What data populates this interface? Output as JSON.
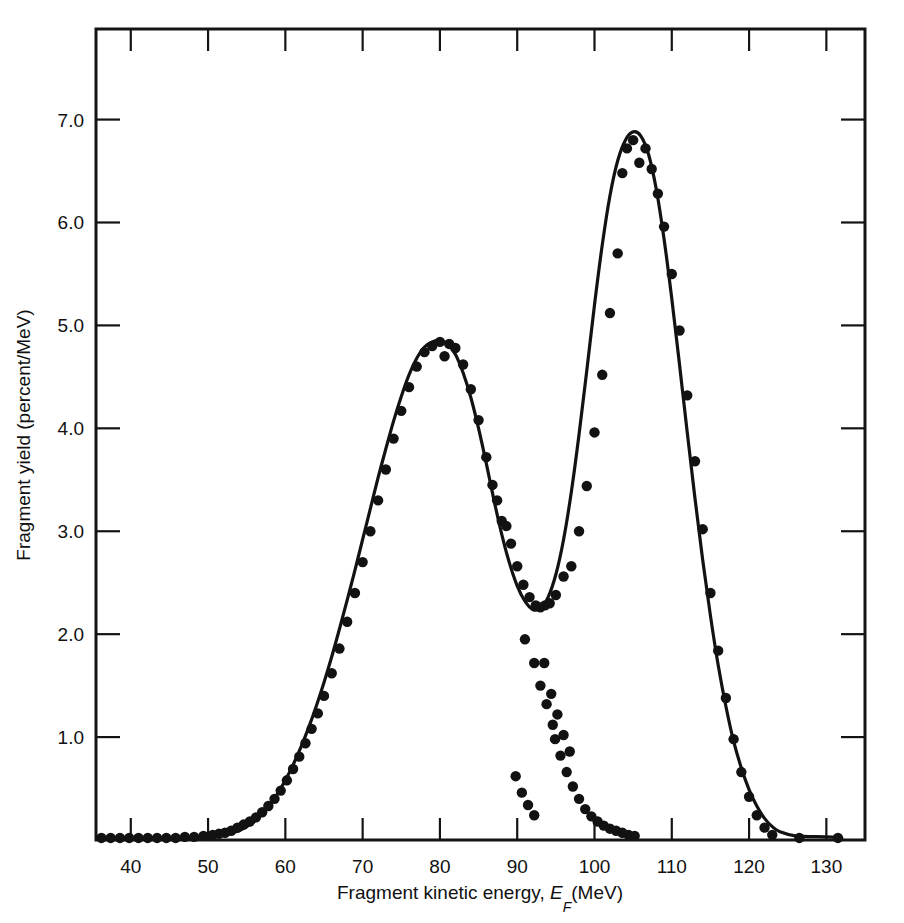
{
  "figure": {
    "background_color": "#ffffff",
    "ink_color": "#121212"
  },
  "axes": {
    "x": {
      "label_main": "Fragment kinetic energy,",
      "label_symbol": "E",
      "label_subscript": "F",
      "label_units": "(MeV)",
      "label_full": "Fragment kinetic energy, E_F(MeV)",
      "ticks": [
        40,
        50,
        60,
        70,
        80,
        90,
        100,
        110,
        120,
        130
      ],
      "tick_labels": [
        "40",
        "50",
        "60",
        "70",
        "80",
        "90",
        "100",
        "110",
        "120",
        "130"
      ],
      "range": [
        35.5,
        135.0
      ]
    },
    "y": {
      "label_full": "Fragment yield (percent/MeV)",
      "ticks": [
        1.0,
        2.0,
        3.0,
        4.0,
        5.0,
        6.0,
        7.0
      ],
      "tick_labels": [
        "1.0",
        "2.0",
        "3.0",
        "4.0",
        "5.0",
        "6.0",
        "7.0"
      ],
      "range": [
        0.0,
        7.88
      ]
    }
  },
  "chart_data": {
    "type": "scatter",
    "title": "",
    "subtitle": "",
    "xlabel": "Fragment kinetic energy, E_F(MeV)",
    "ylabel": "Fragment yield (percent/MeV)",
    "xlim": [
      35.5,
      135.0
    ],
    "ylim": [
      0.0,
      7.88
    ],
    "grid": false,
    "legend": "none",
    "series": [
      {
        "name": "fitted-curve",
        "type": "line",
        "marker": "none",
        "x": [
          36.0,
          40.0,
          44.0,
          48.0,
          52.0,
          54.0,
          55.0,
          56.0,
          57.0,
          58.0,
          59.0,
          60.0,
          61.0,
          62.0,
          63.0,
          64.0,
          65.0,
          66.0,
          67.0,
          68.0,
          69.0,
          70.0,
          71.0,
          72.0,
          73.0,
          74.0,
          75.0,
          76.0,
          77.0,
          78.0,
          79.0,
          80.0,
          81.0,
          82.0,
          83.0,
          84.0,
          85.0,
          86.0,
          87.0,
          88.0,
          89.0,
          90.0,
          91.0,
          92.0,
          93.0,
          94.0,
          95.0,
          96.0,
          97.0,
          98.0,
          99.0,
          100.0,
          101.0,
          102.0,
          103.0,
          104.0,
          105.0,
          106.0,
          107.0,
          108.0,
          109.0,
          110.0,
          111.0,
          112.0,
          113.0,
          114.0,
          115.0,
          116.0,
          117.0,
          118.0,
          119.0,
          120.0,
          121.0,
          122.0,
          123.0,
          124.0,
          126.0,
          130.0,
          132.0
        ],
        "y": [
          0.02,
          0.02,
          0.02,
          0.03,
          0.05,
          0.09,
          0.13,
          0.18,
          0.25,
          0.34,
          0.45,
          0.58,
          0.73,
          0.9,
          1.09,
          1.3,
          1.53,
          1.78,
          2.05,
          2.33,
          2.62,
          2.92,
          3.22,
          3.52,
          3.8,
          4.07,
          4.31,
          4.52,
          4.68,
          4.79,
          4.84,
          4.85,
          4.82,
          4.72,
          4.54,
          4.3,
          4.0,
          3.66,
          3.3,
          2.97,
          2.69,
          2.47,
          2.32,
          2.24,
          2.25,
          2.36,
          2.58,
          2.92,
          3.38,
          3.94,
          4.56,
          5.2,
          5.78,
          6.26,
          6.6,
          6.8,
          6.88,
          6.84,
          6.66,
          6.32,
          5.84,
          5.26,
          4.62,
          3.96,
          3.32,
          2.72,
          2.18,
          1.7,
          1.3,
          0.96,
          0.7,
          0.49,
          0.33,
          0.21,
          0.13,
          0.08,
          0.04,
          0.03,
          0.02
        ]
      },
      {
        "name": "measured-yield-points",
        "type": "scatter",
        "marker": "filled-circle",
        "x": [
          36.2,
          37.4,
          38.6,
          39.8,
          41.0,
          42.2,
          43.4,
          44.6,
          45.8,
          47.0,
          48.2,
          49.4,
          50.6,
          51.4,
          52.2,
          53.0,
          53.8,
          54.6,
          55.4,
          56.2,
          57.0,
          57.8,
          58.6,
          59.4,
          60.2,
          61.0,
          61.8,
          62.6,
          63.4,
          64.2,
          65.0,
          66.0,
          67.0,
          68.0,
          69.0,
          70.0,
          71.0,
          72.0,
          73.0,
          74.0,
          75.0,
          76.0,
          77.0,
          78.0,
          79.0,
          80.0,
          80.6,
          81.2,
          82.0,
          83.0,
          84.0,
          85.0,
          86.0,
          86.8,
          87.4,
          88.0,
          88.6,
          89.2,
          90.0,
          90.8,
          91.6,
          92.4,
          93.0,
          93.6,
          94.2,
          95.0,
          96.0,
          97.0,
          98.0,
          99.0,
          100.0,
          101.0,
          102.0,
          103.0,
          103.6,
          104.2,
          105.0,
          105.8,
          106.6,
          107.4,
          108.2,
          109.0,
          110.0,
          111.0,
          112.0,
          113.0,
          114.0,
          115.0,
          116.0,
          117.0,
          118.0,
          119.0,
          120.0,
          121.0,
          122.0,
          123.0,
          126.5,
          131.5
        ],
        "y": [
          0.02,
          0.02,
          0.02,
          0.02,
          0.02,
          0.02,
          0.02,
          0.02,
          0.02,
          0.03,
          0.03,
          0.04,
          0.05,
          0.06,
          0.07,
          0.09,
          0.12,
          0.15,
          0.18,
          0.22,
          0.27,
          0.33,
          0.4,
          0.48,
          0.58,
          0.69,
          0.81,
          0.94,
          1.08,
          1.23,
          1.4,
          1.62,
          1.86,
          2.12,
          2.4,
          2.7,
          3.0,
          3.3,
          3.6,
          3.9,
          4.17,
          4.4,
          4.6,
          4.74,
          4.8,
          4.84,
          4.7,
          4.82,
          4.78,
          4.62,
          4.38,
          4.08,
          3.72,
          3.45,
          3.3,
          3.1,
          3.05,
          2.88,
          2.66,
          2.48,
          2.36,
          2.28,
          2.26,
          2.28,
          2.3,
          2.38,
          2.56,
          2.66,
          3.0,
          3.44,
          3.96,
          4.52,
          5.12,
          5.7,
          6.48,
          6.72,
          6.8,
          6.58,
          6.72,
          6.52,
          6.28,
          5.96,
          5.5,
          4.95,
          4.32,
          3.68,
          3.02,
          2.4,
          1.84,
          1.38,
          0.98,
          0.66,
          0.42,
          0.24,
          0.12,
          0.05,
          0.02,
          0.02
        ]
      },
      {
        "name": "symmetric-fission-component-points",
        "type": "scatter",
        "marker": "filled-circle",
        "x": [
          91.0,
          92.2,
          93.0,
          93.8,
          94.6,
          94.9,
          95.6,
          96.4,
          97.2,
          98.0,
          98.8,
          99.6,
          100.4,
          101.2,
          102.0,
          102.8,
          103.6,
          104.4,
          105.2,
          93.5,
          94.4,
          95.2,
          96.0,
          96.8,
          89.8,
          90.6,
          91.4,
          92.2
        ],
        "y": [
          1.95,
          1.72,
          1.5,
          1.32,
          1.12,
          0.98,
          0.82,
          0.66,
          0.52,
          0.4,
          0.3,
          0.23,
          0.18,
          0.14,
          0.11,
          0.09,
          0.07,
          0.05,
          0.04,
          1.72,
          1.42,
          1.22,
          1.02,
          0.86,
          0.62,
          0.46,
          0.34,
          0.24
        ]
      }
    ]
  }
}
